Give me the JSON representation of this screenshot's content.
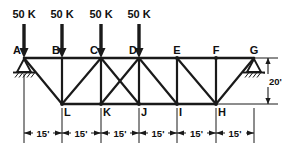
{
  "figure": {
    "type": "structural-truss-diagram",
    "line_color": "#1a1a1a",
    "text_color": "#101010",
    "background": "#ffffff"
  },
  "loads": {
    "count": 4,
    "items": [
      {
        "label": "50 K",
        "at_node": "A"
      },
      {
        "label": "50 K",
        "at_node": "B"
      },
      {
        "label": "50 K",
        "at_node": "C"
      },
      {
        "label": "50 K",
        "at_node": "D"
      }
    ]
  },
  "nodes": {
    "top_chord": [
      {
        "label": "A",
        "x": 24,
        "y": 58
      },
      {
        "label": "B",
        "x": 62,
        "y": 58
      },
      {
        "label": "C",
        "x": 101,
        "y": 58
      },
      {
        "label": "D",
        "x": 139,
        "y": 58
      },
      {
        "label": "E",
        "x": 177,
        "y": 58
      },
      {
        "label": "F",
        "x": 216,
        "y": 58
      },
      {
        "label": "G",
        "x": 254,
        "y": 58
      }
    ],
    "bottom_chord": [
      {
        "label": "L",
        "x": 62,
        "y": 104
      },
      {
        "label": "K",
        "x": 101,
        "y": 104
      },
      {
        "label": "J",
        "x": 139,
        "y": 104
      },
      {
        "label": "I",
        "x": 177,
        "y": 104
      },
      {
        "label": "H",
        "x": 216,
        "y": 104
      }
    ]
  },
  "supports": {
    "left": {
      "node": "A",
      "type": "pin"
    },
    "right": {
      "node": "G",
      "type": "roller"
    }
  },
  "dimensions": {
    "horizontal": {
      "labels": [
        "15'",
        "15'",
        "15'",
        "15'",
        "15'",
        "15'"
      ],
      "count": 6
    },
    "vertical": {
      "label": "20'"
    }
  }
}
